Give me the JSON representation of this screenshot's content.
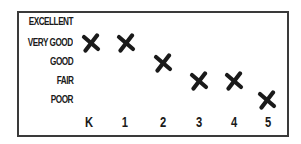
{
  "chart_data": {
    "type": "scatter",
    "title": "",
    "xlabel": "",
    "ylabel": "",
    "categories": [
      "K",
      "1",
      "2",
      "3",
      "4",
      "5"
    ],
    "y_categories": [
      "POOR",
      "FAIR",
      "GOOD",
      "VERY GOOD",
      "EXCELLENT"
    ],
    "series": [
      {
        "name": "rating",
        "marker": "x",
        "values": [
          "VERY GOOD",
          "VERY GOOD",
          "GOOD",
          "FAIR",
          "FAIR",
          "POOR"
        ],
        "numeric_values": [
          4,
          4,
          3,
          2,
          2,
          1
        ]
      }
    ],
    "ylim": [
      1,
      5
    ],
    "grid": false,
    "legend": "none"
  },
  "labels": {
    "y": [
      "EXCELLENT",
      "VERY GOOD",
      "GOOD",
      "FAIR",
      "POOR"
    ],
    "x": [
      "K",
      "1",
      "2",
      "3",
      "4",
      "5"
    ]
  },
  "colors": {
    "mark": "#1a1a1a",
    "border": "#3a3a3a",
    "text": "#1a1a1a"
  }
}
